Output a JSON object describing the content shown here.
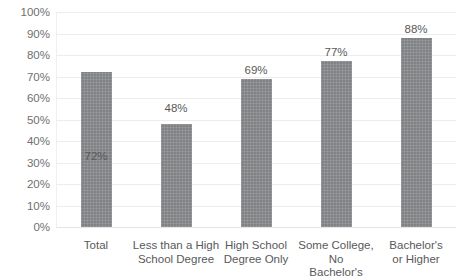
{
  "chart_data": {
    "type": "bar",
    "title": "",
    "subtitle": "",
    "xlabel": "",
    "ylabel": "",
    "ylim": [
      0,
      100
    ],
    "y_tick_labels": [
      "100%",
      "90%",
      "80%",
      "70%",
      "60%",
      "50%",
      "40%",
      "30%",
      "20%",
      "10%",
      "0%"
    ],
    "y_ticks": [
      100,
      90,
      80,
      70,
      60,
      50,
      40,
      30,
      20,
      10,
      0
    ],
    "grid": "horizontal",
    "legend": "none",
    "categories": [
      "Total",
      "Less than a High School Degree",
      "High School Degree Only",
      "Some College, No Bachelor's",
      "Bachelor's or Higher"
    ],
    "category_label_lines": [
      [
        "Total"
      ],
      [
        "Less than a High",
        "School Degree"
      ],
      [
        "High School",
        "Degree Only"
      ],
      [
        "Some College, No",
        "Bachelor's"
      ],
      [
        "Bachelor's",
        "or Higher"
      ]
    ],
    "values": [
      72,
      48,
      69,
      77,
      88
    ],
    "data_labels": [
      "72%",
      "48%",
      "69%",
      "77%",
      "88%"
    ],
    "bar_color": "#808285",
    "gridline_color": "#ededee",
    "text_color": "#58595b",
    "axis_text_color": "#6f7072",
    "background_color": "#ffffff"
  }
}
